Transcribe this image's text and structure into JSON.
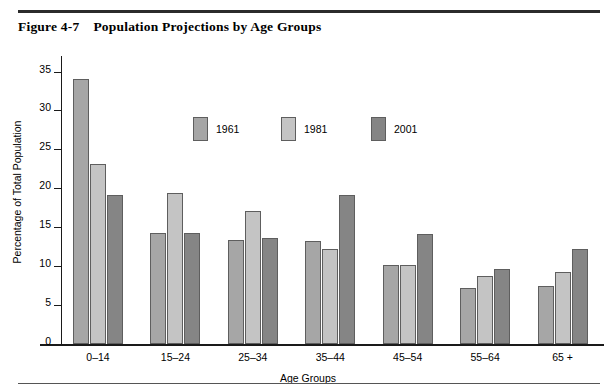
{
  "figure": {
    "number": "Figure 4-7",
    "caption": "Population Projections by Age Groups"
  },
  "chart_data": {
    "type": "bar",
    "title": "Population Projections by Age Groups",
    "xlabel": "Age Groups",
    "ylabel": "Percentage of Total Population",
    "categories": [
      "0–14",
      "15–24",
      "25–34",
      "35–44",
      "45–54",
      "55–64",
      "65 +"
    ],
    "series": [
      {
        "name": "1961",
        "color": "#a6a6a6",
        "values": [
          34.0,
          14.2,
          13.3,
          13.2,
          10.1,
          7.2,
          7.5
        ]
      },
      {
        "name": "1981",
        "color": "#c4c4c4",
        "values": [
          23.1,
          19.4,
          17.1,
          12.2,
          10.2,
          8.8,
          9.3
        ]
      },
      {
        "name": "2001",
        "color": "#858585",
        "values": [
          19.1,
          14.2,
          13.6,
          19.1,
          14.1,
          9.7,
          12.2
        ]
      }
    ],
    "ylim": [
      0,
      37
    ],
    "yticks": [
      0,
      5,
      10,
      15,
      20,
      25,
      30,
      35
    ],
    "ytick_labels": [
      "0",
      "5",
      "10",
      "15",
      "20",
      "25",
      "30",
      "35"
    ],
    "grid": false,
    "legend_position": "inside-top-center"
  }
}
